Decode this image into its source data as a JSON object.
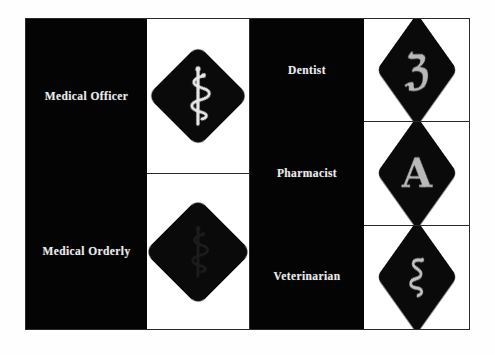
{
  "page": {
    "background_color": "#ffffff",
    "frame_border_color": "#2a2a2a",
    "label_panel_color": "#040404",
    "figure_panel_color": "#ffffff",
    "label_text_color": "#e9e9e9",
    "diamond_color": "#0a0a0a",
    "glyph_color": "#b9b9b9"
  },
  "columns": {
    "officers": {
      "labels": [
        {
          "text": "Medical Officer",
          "icon": "rod-of-asclepius-light-icon"
        },
        {
          "text": "Medical Orderly",
          "icon": "rod-of-asclepius-dark-icon"
        }
      ]
    },
    "specialists": {
      "labels": [
        {
          "text": "Dentist",
          "icon": "fraktur-z-icon",
          "glyph": "ℨ"
        },
        {
          "text": "Pharmacist",
          "icon": "fraktur-a-icon",
          "glyph": "A"
        },
        {
          "text": "Veterinarian",
          "icon": "serpent-icon",
          "glyph": ""
        }
      ]
    }
  },
  "badges": {
    "medical_officer": {
      "shape": "diamond",
      "symbol_name": "rod-of-asclepius",
      "symbol_tone": "light"
    },
    "medical_orderly": {
      "shape": "diamond",
      "symbol_name": "rod-of-asclepius",
      "symbol_tone": "dark"
    },
    "dentist": {
      "shape": "diamond",
      "symbol_name": "fraktur-letter-z",
      "symbol_tone": "light"
    },
    "pharmacist": {
      "shape": "diamond",
      "symbol_name": "fraktur-letter-a",
      "symbol_tone": "light"
    },
    "veterinarian": {
      "shape": "diamond",
      "symbol_name": "serpent",
      "symbol_tone": "light"
    }
  }
}
